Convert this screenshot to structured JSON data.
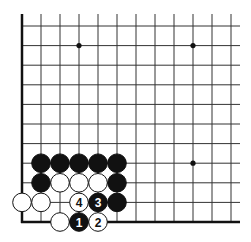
{
  "diagram": {
    "type": "go-board-corner",
    "grid": {
      "cols": 12,
      "rows": 11,
      "origin_x": 22,
      "bottom_y": 222,
      "spacing_x": 19,
      "spacing_y": 19.6
    },
    "star_points": [
      {
        "col": 3,
        "row": 9
      },
      {
        "col": 9,
        "row": 9
      },
      {
        "col": 9,
        "row": 3
      }
    ],
    "stones": [
      {
        "col": 1,
        "row": 3,
        "color": "black"
      },
      {
        "col": 2,
        "row": 3,
        "color": "black"
      },
      {
        "col": 3,
        "row": 3,
        "color": "black"
      },
      {
        "col": 4,
        "row": 3,
        "color": "black"
      },
      {
        "col": 5,
        "row": 3,
        "color": "black"
      },
      {
        "col": 1,
        "row": 2,
        "color": "black"
      },
      {
        "col": 2,
        "row": 2,
        "color": "white"
      },
      {
        "col": 3,
        "row": 2,
        "color": "white"
      },
      {
        "col": 4,
        "row": 2,
        "color": "white"
      },
      {
        "col": 5,
        "row": 2,
        "color": "black"
      },
      {
        "col": 0,
        "row": 1,
        "color": "white"
      },
      {
        "col": 1,
        "row": 1,
        "color": "white"
      },
      {
        "col": 3,
        "row": 1,
        "color": "white",
        "label": "4"
      },
      {
        "col": 4,
        "row": 1,
        "color": "black",
        "label": "3"
      },
      {
        "col": 5,
        "row": 1,
        "color": "black"
      },
      {
        "col": 2,
        "row": 0,
        "color": "white"
      },
      {
        "col": 3,
        "row": 0,
        "color": "black",
        "label": "1"
      },
      {
        "col": 4,
        "row": 0,
        "color": "white",
        "label": "2"
      }
    ],
    "colors": {
      "black": "#111111",
      "white": "#ffffff",
      "line": "#333333"
    }
  }
}
